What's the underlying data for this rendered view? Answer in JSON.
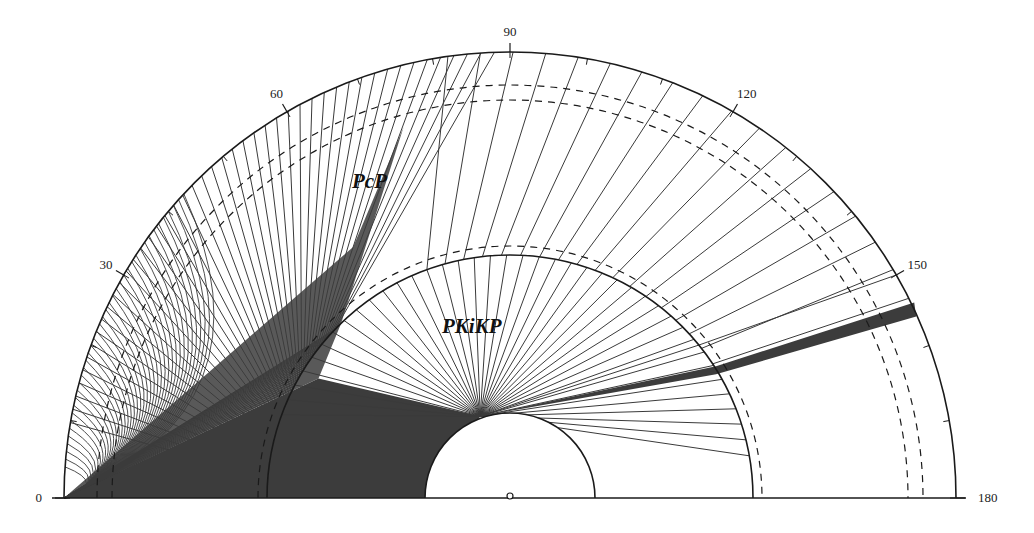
{
  "figure": {
    "type": "seismic-ray-path-diagram",
    "center": [
      510,
      498
    ],
    "radii": {
      "surface": 446,
      "core_mantle_boundary": 243,
      "inner_core_boundary": 85
    },
    "dashed_radii": [
      398,
      413,
      252
    ],
    "distance_axis": {
      "ticks": [
        0,
        30,
        60,
        90,
        120,
        150,
        180
      ],
      "labels": [
        "0",
        "30",
        "60",
        "90",
        "120",
        "150",
        "180"
      ],
      "minor_tick_step_deg": 10
    },
    "phases": [
      {
        "name": "PcP",
        "label": "PcP",
        "label_pos": [
          352,
          188
        ]
      },
      {
        "name": "PKiKP",
        "label": "PKiKP",
        "label_pos": [
          442,
          333
        ]
      }
    ],
    "colors": {
      "ink": "#1a1a1a",
      "ray": "#3a3a3a",
      "caustic_fill": "#3c3c3c",
      "background": "#ffffff"
    },
    "pcp_rays": {
      "count": 46,
      "max_distance_deg": 80
    },
    "pkikp_rays": {
      "count": 40,
      "min_distance_deg": 115,
      "max_distance_deg": 153
    },
    "inner_core_marker": "small-circle-at-center"
  }
}
